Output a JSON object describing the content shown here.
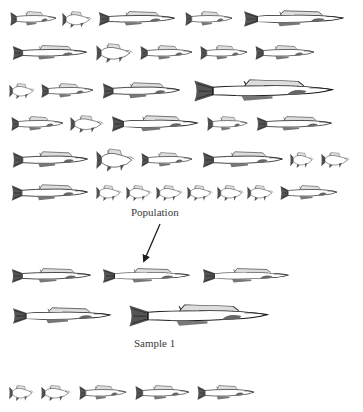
{
  "diagram": {
    "title": "",
    "colors": {
      "ink": "#1e1e1e",
      "background": "#ffffff",
      "label": "#3a3a3a"
    },
    "population": {
      "label": "Population",
      "label_pos": {
        "x": 131,
        "y": 206
      },
      "rows": [
        {
          "cy": 19,
          "fish": [
            {
              "x": 10,
              "w": 47,
              "h": 20,
              "kind": "medium"
            },
            {
              "x": 62,
              "w": 30,
              "h": 19,
              "kind": "short"
            },
            {
              "x": 98,
              "w": 78,
              "h": 20,
              "kind": "long"
            },
            {
              "x": 185,
              "w": 48,
              "h": 20,
              "kind": "medium"
            },
            {
              "x": 243,
              "w": 102,
              "h": 22,
              "kind": "long"
            }
          ]
        },
        {
          "cy": 53,
          "fish": [
            {
              "x": 12,
              "w": 76,
              "h": 20,
              "kind": "long"
            },
            {
              "x": 96,
              "w": 37,
              "h": 22,
              "kind": "short"
            },
            {
              "x": 140,
              "w": 53,
              "h": 20,
              "kind": "medium"
            },
            {
              "x": 200,
              "w": 48,
              "h": 20,
              "kind": "medium"
            },
            {
              "x": 255,
              "w": 60,
              "h": 20,
              "kind": "medium"
            }
          ]
        },
        {
          "cy": 91,
          "fish": [
            {
              "x": 9,
              "w": 26,
              "h": 18,
              "kind": "short"
            },
            {
              "x": 41,
              "w": 53,
              "h": 20,
              "kind": "medium"
            },
            {
              "x": 102,
              "w": 79,
              "h": 22,
              "kind": "long"
            },
            {
              "x": 193,
              "w": 142,
              "h": 30,
              "kind": "long"
            }
          ]
        },
        {
          "cy": 124,
          "fish": [
            {
              "x": 11,
              "w": 53,
              "h": 20,
              "kind": "medium"
            },
            {
              "x": 70,
              "w": 34,
              "h": 20,
              "kind": "short"
            },
            {
              "x": 111,
              "w": 88,
              "h": 22,
              "kind": "long"
            },
            {
              "x": 207,
              "w": 41,
              "h": 20,
              "kind": "medium"
            },
            {
              "x": 256,
              "w": 77,
              "h": 20,
              "kind": "long"
            }
          ]
        },
        {
          "cy": 160,
          "fish": [
            {
              "x": 12,
              "w": 77,
              "h": 22,
              "kind": "long"
            },
            {
              "x": 96,
              "w": 39,
              "h": 26,
              "kind": "short"
            },
            {
              "x": 141,
              "w": 52,
              "h": 20,
              "kind": "medium"
            },
            {
              "x": 202,
              "w": 82,
              "h": 22,
              "kind": "long"
            },
            {
              "x": 290,
              "w": 24,
              "h": 18,
              "kind": "short"
            },
            {
              "x": 321,
              "w": 29,
              "h": 18,
              "kind": "short"
            }
          ]
        },
        {
          "cy": 193,
          "fish": [
            {
              "x": 11,
              "w": 78,
              "h": 22,
              "kind": "long"
            },
            {
              "x": 96,
              "w": 26,
              "h": 18,
              "kind": "short"
            },
            {
              "x": 126,
              "w": 26,
              "h": 18,
              "kind": "short"
            },
            {
              "x": 156,
              "w": 27,
              "h": 18,
              "kind": "short"
            },
            {
              "x": 187,
              "w": 26,
              "h": 18,
              "kind": "short"
            },
            {
              "x": 217,
              "w": 27,
              "h": 18,
              "kind": "short"
            },
            {
              "x": 247,
              "w": 27,
              "h": 18,
              "kind": "short"
            },
            {
              "x": 280,
              "w": 58,
              "h": 20,
              "kind": "medium"
            }
          ]
        }
      ]
    },
    "arrow": {
      "from": {
        "x": 160,
        "y": 224
      },
      "to": {
        "x": 144,
        "y": 261
      }
    },
    "sample_1": {
      "label": "Sample 1",
      "label_pos": {
        "x": 134,
        "y": 337
      },
      "rows": [
        {
          "cy": 276,
          "fish": [
            {
              "x": 11,
              "w": 81,
              "h": 20,
              "kind": "long"
            },
            {
              "x": 102,
              "w": 89,
              "h": 20,
              "kind": "long"
            },
            {
              "x": 202,
              "w": 88,
              "h": 20,
              "kind": "long"
            }
          ]
        },
        {
          "cy": 316,
          "fish": [
            {
              "x": 12,
              "w": 100,
              "h": 22,
              "kind": "long"
            },
            {
              "x": 128,
              "w": 142,
              "h": 30,
              "kind": "long"
            }
          ]
        }
      ]
    },
    "bottom_sample": {
      "rows": [
        {
          "cy": 393,
          "fish": [
            {
              "x": 9,
              "w": 25,
              "h": 18,
              "kind": "short"
            },
            {
              "x": 41,
              "w": 30,
              "h": 18,
              "kind": "short"
            },
            {
              "x": 79,
              "w": 48,
              "h": 20,
              "kind": "medium"
            },
            {
              "x": 135,
              "w": 55,
              "h": 20,
              "kind": "medium"
            },
            {
              "x": 197,
              "w": 58,
              "h": 20,
              "kind": "medium"
            }
          ]
        }
      ]
    }
  }
}
